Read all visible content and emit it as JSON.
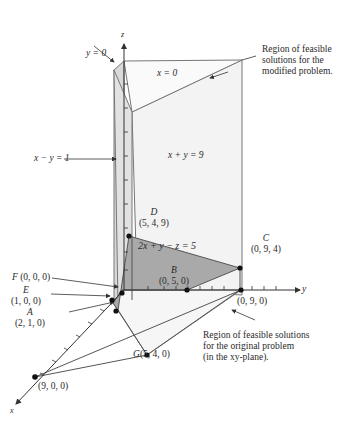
{
  "axes": {
    "x": "x",
    "y": "y",
    "z": "z"
  },
  "planes": {
    "y0": "y = 0",
    "x0": "x = 0",
    "xmy1": "x − y = 1",
    "xpy9": "x + y = 9",
    "constraint": "2x + y − z = 5"
  },
  "points": {
    "D": {
      "name": "D",
      "coords": "(5, 4, 9)"
    },
    "C": {
      "name": "C",
      "coords": "(0, 9, 4)"
    },
    "B": {
      "name": "B",
      "coords": "(0, 5, 0)"
    },
    "F": {
      "name": "F",
      "coords": "(0, 0, 0)"
    },
    "E": {
      "name": "E",
      "coords": "(1, 0, 0)"
    },
    "A": {
      "name": "A",
      "coords": "(2, 1, 0)"
    },
    "G": {
      "name": "G",
      "coords": "(5, 4, 0)"
    },
    "Y9": {
      "coords": "(0, 9, 0)"
    },
    "X9": {
      "coords": "(9, 0, 0)"
    }
  },
  "annotations": {
    "modified": [
      "Region of feasible",
      "solutions for the",
      "modified problem."
    ],
    "original": [
      "Region of feasible solutions",
      "for the original problem",
      "(in the xy-plane)."
    ]
  },
  "colors": {
    "light_region": "#f2f2f2",
    "dark_region": "#a6a6a6",
    "mid_region": "#d4d4d4",
    "edge": "#666666",
    "axis": "#333333"
  }
}
